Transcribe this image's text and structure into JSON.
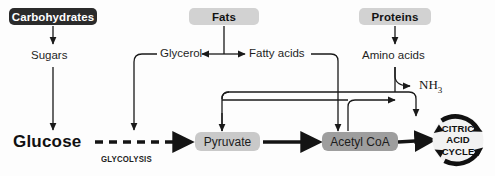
{
  "diagram": {
    "background_color": "#fdfdfd",
    "line_color": "#1a1a1a"
  },
  "sources": [
    {
      "id": "carbohydrates",
      "label": "Carbohydrates",
      "box_color": "#2b2b2b",
      "text_color": "#ffffff"
    },
    {
      "id": "fats",
      "label": "Fats",
      "box_color": "#d2d2d2",
      "text_color": "#121212"
    },
    {
      "id": "proteins",
      "label": "Proteins",
      "box_color": "#d2d2d2",
      "text_color": "#121212"
    }
  ],
  "intermediates": [
    {
      "id": "sugars",
      "label": "Sugars"
    },
    {
      "id": "glycerol",
      "label": "Glycerol"
    },
    {
      "id": "fatty_acids",
      "label": "Fatty acids"
    },
    {
      "id": "amino_acids",
      "label": "Amino acids"
    }
  ],
  "byproducts": [
    {
      "id": "ammonia",
      "label": "NH",
      "subscript": "3"
    }
  ],
  "hubs": [
    {
      "id": "glucose",
      "label": "Glucose",
      "style": "large-bold"
    },
    {
      "id": "pyruvate",
      "label": "Pyruvate",
      "box_color": "#c9c9c9"
    },
    {
      "id": "acetyl_coa",
      "label": "Acetyl CoA",
      "box_color": "#9e9e9e"
    }
  ],
  "pathways": [
    {
      "id": "glycolysis",
      "label": "GLYCOLYSIS",
      "style": "dashed-arrow",
      "from": "glucose",
      "to": "pyruvate"
    }
  ],
  "cycle": {
    "id": "citric_acid_cycle",
    "line1": "CITRIC",
    "line2": "ACID",
    "line3": "CYCLE",
    "ring_color": "#111111"
  }
}
